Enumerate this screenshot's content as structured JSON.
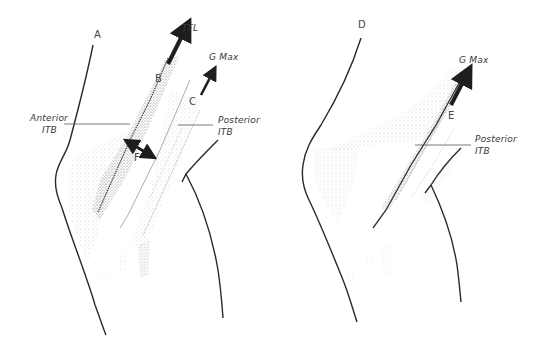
{
  "figures": [
    {
      "id": "left",
      "letters": {
        "a": "A",
        "b": "B",
        "c": "C",
        "f": "F"
      },
      "labels": {
        "tfl": "TFL",
        "gmax": "G Max",
        "anterior_itb_line1": "Anterior",
        "anterior_itb_line2": "ITB",
        "posterior_itb_line1": "Posterior",
        "posterior_itb_line2": "ITB"
      },
      "arrows": [
        {
          "name": "TFL",
          "direction": "up-right",
          "weight": "thick"
        },
        {
          "name": "G Max",
          "direction": "up-right",
          "weight": "medium"
        },
        {
          "name": "F",
          "direction": "bidirectional",
          "weight": "thick"
        }
      ]
    },
    {
      "id": "right",
      "letters": {
        "d": "D",
        "e": "E"
      },
      "labels": {
        "gmax": "G Max",
        "posterior_itb_line1": "Posterior",
        "posterior_itb_line2": "ITB"
      },
      "arrows": [
        {
          "name": "G Max",
          "direction": "up-right",
          "weight": "thick"
        }
      ]
    }
  ],
  "colors": {
    "outline": "#2a2a2a",
    "arrow": "#1e1e1e",
    "stipple": "#6a6a6a",
    "leader_line": "#555555",
    "background": "#ffffff"
  }
}
